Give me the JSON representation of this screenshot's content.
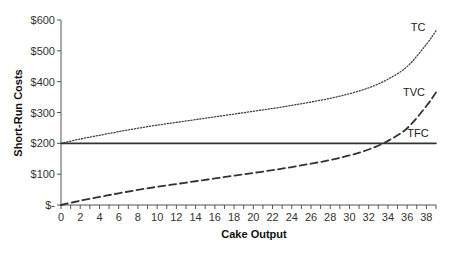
{
  "chart_data": {
    "type": "line",
    "title": "",
    "xlabel": "Cake Output",
    "ylabel": "Short-Run Costs",
    "xlim": [
      0,
      39
    ],
    "ylim": [
      0,
      600
    ],
    "grid": false,
    "legend_position": "inline labels at right end of curves",
    "x_ticks": [
      0,
      2,
      4,
      6,
      8,
      10,
      12,
      14,
      16,
      18,
      20,
      22,
      24,
      26,
      28,
      30,
      32,
      34,
      36,
      38
    ],
    "x_tick_labels": [
      "0",
      "2",
      "4",
      "6",
      "8",
      "10",
      "12",
      "14",
      "16",
      "18",
      "20",
      "22",
      "24",
      "26",
      "28",
      "30",
      "32",
      "34",
      "36",
      "38"
    ],
    "y_ticks": [
      0,
      100,
      200,
      300,
      400,
      500,
      600
    ],
    "y_tick_labels": [
      "$-",
      "$100",
      "$200",
      "$300",
      "$400",
      "$500",
      "$600"
    ],
    "x": [
      0,
      2,
      4,
      6,
      8,
      10,
      12,
      14,
      16,
      18,
      20,
      22,
      24,
      26,
      28,
      30,
      32,
      34,
      36,
      38,
      39
    ],
    "series": [
      {
        "name": "TC",
        "style": "dotted",
        "values": [
          200,
          214,
          226,
          238,
          249,
          259,
          268,
          277,
          286,
          295,
          304,
          313,
          323,
          334,
          346,
          361,
          380,
          408,
          449,
          521,
          565
        ]
      },
      {
        "name": "TVC",
        "style": "dashed",
        "values": [
          0,
          14,
          26,
          38,
          49,
          59,
          68,
          77,
          86,
          95,
          104,
          113,
          123,
          134,
          146,
          161,
          180,
          208,
          249,
          321,
          365
        ]
      },
      {
        "name": "TFC",
        "style": "solid",
        "values": [
          200,
          200,
          200,
          200,
          200,
          200,
          200,
          200,
          200,
          200,
          200,
          200,
          200,
          200,
          200,
          200,
          200,
          200,
          200,
          200,
          200
        ]
      }
    ],
    "annotations": [
      {
        "text": "TC",
        "near": "end of TC curve"
      },
      {
        "text": "TVC",
        "near": "end of TVC curve"
      },
      {
        "text": "TFC",
        "near": "end of TFC line"
      }
    ]
  },
  "colors": {
    "axis": "#555555",
    "tc": "#444444",
    "tvc": "#333333",
    "tfc": "#333333"
  }
}
